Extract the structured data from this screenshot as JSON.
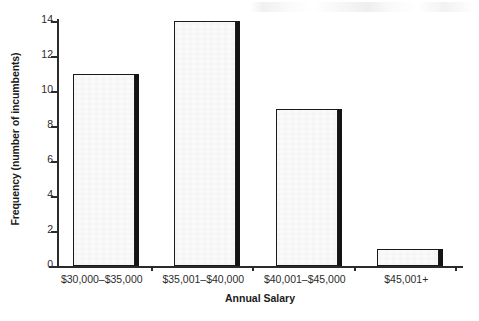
{
  "chart_data": {
    "type": "bar",
    "title": "",
    "subtitle": "",
    "xlabel": "Annual Salary",
    "ylabel": "Frequency (number of incumbents)",
    "categories": [
      "$30,000–$35,000",
      "$35,001–$40,000",
      "$40,001–$45,000",
      "$45,001+"
    ],
    "values": [
      11,
      14,
      9,
      1
    ],
    "ylim": [
      0,
      14
    ],
    "yticks": [
      0,
      2,
      4,
      6,
      8,
      10,
      12,
      14
    ],
    "ytick_labels": [
      "0",
      "2",
      "4",
      "6",
      "8",
      "10",
      "12",
      "14"
    ],
    "grid": false,
    "legend": null,
    "legend_position": "none",
    "series": [
      {
        "name": "Frequency",
        "values": [
          11,
          14,
          9,
          1
        ]
      }
    ],
    "style": {
      "bar_fill": "#fafafa",
      "bar_edge": "#1a1a1a",
      "bar_shadow": "#141414",
      "axis_color": "#2b2b2b",
      "text_color": "#1b1b1b",
      "background": "#ffffff"
    }
  }
}
